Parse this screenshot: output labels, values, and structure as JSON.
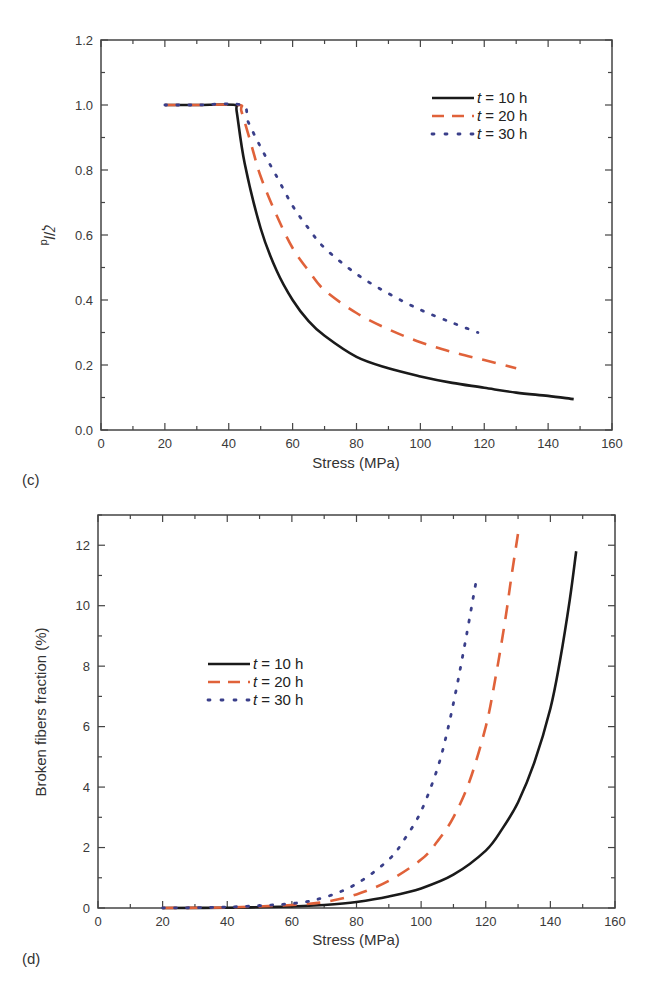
{
  "colors": {
    "t10": "#1a1a1a",
    "t20": "#e0623a",
    "t30": "#3a3f8a",
    "axis": "#444444"
  },
  "chart_data": [
    {
      "panel": "(c)",
      "type": "line",
      "title": "",
      "xlabel": "Stress (MPa)",
      "ylabel": "ζ/ld",
      "xlim": [
        0,
        160
      ],
      "ylim": [
        0.0,
        1.2
      ],
      "xticks": [
        0,
        20,
        40,
        60,
        80,
        100,
        120,
        140,
        160
      ],
      "yticks": [
        "0.0",
        "0.2",
        "0.4",
        "0.6",
        "0.8",
        "1.0",
        "1.2"
      ],
      "grid": false,
      "legend_position": "upper right",
      "series": [
        {
          "name": "t = 10 h",
          "style": "solid",
          "x": [
            20,
            30,
            42,
            42.5,
            45,
            50,
            55,
            60,
            65,
            70,
            80,
            90,
            100,
            110,
            120,
            130,
            140,
            148
          ],
          "y": [
            1.0,
            1.0,
            1.0,
            0.98,
            0.82,
            0.62,
            0.49,
            0.4,
            0.335,
            0.29,
            0.225,
            0.19,
            0.165,
            0.145,
            0.13,
            0.115,
            0.105,
            0.095
          ]
        },
        {
          "name": "t = 20 h",
          "style": "dashed",
          "x": [
            20,
            30,
            43,
            44,
            47,
            50,
            55,
            60,
            65,
            70,
            80,
            90,
            100,
            110,
            120,
            130
          ],
          "y": [
            1.0,
            1.0,
            1.0,
            0.98,
            0.88,
            0.78,
            0.66,
            0.56,
            0.49,
            0.43,
            0.36,
            0.31,
            0.27,
            0.24,
            0.215,
            0.19
          ]
        },
        {
          "name": "t = 30 h",
          "style": "dotted",
          "x": [
            20,
            30,
            44,
            46,
            50,
            55,
            60,
            65,
            70,
            80,
            90,
            100,
            110,
            118
          ],
          "y": [
            1.0,
            1.0,
            1.0,
            0.95,
            0.87,
            0.78,
            0.69,
            0.62,
            0.56,
            0.48,
            0.42,
            0.37,
            0.33,
            0.3
          ]
        }
      ]
    },
    {
      "panel": "(d)",
      "type": "line",
      "title": "",
      "xlabel": "Stress (MPa)",
      "ylabel": "Broken fibers fraction (%)",
      "xlim": [
        0,
        160
      ],
      "ylim": [
        0,
        13
      ],
      "xticks": [
        0,
        20,
        40,
        60,
        80,
        100,
        120,
        140,
        160
      ],
      "yticks": [
        "0",
        "2",
        "4",
        "6",
        "8",
        "10",
        "12"
      ],
      "grid": false,
      "legend_position": "center left",
      "series": [
        {
          "name": "t = 10 h",
          "style": "solid",
          "x": [
            20,
            40,
            60,
            70,
            80,
            90,
            100,
            110,
            120,
            125,
            130,
            135,
            140,
            143,
            146,
            148
          ],
          "y": [
            0,
            0.01,
            0.05,
            0.1,
            0.2,
            0.38,
            0.65,
            1.1,
            1.9,
            2.6,
            3.5,
            4.8,
            6.6,
            8.2,
            10.2,
            11.8
          ]
        },
        {
          "name": "t = 20 h",
          "style": "dashed",
          "x": [
            20,
            40,
            60,
            70,
            80,
            90,
            100,
            105,
            110,
            115,
            120,
            123,
            126,
            128,
            130
          ],
          "y": [
            0,
            0.02,
            0.1,
            0.2,
            0.45,
            0.9,
            1.6,
            2.2,
            3.0,
            4.2,
            6.0,
            7.6,
            9.5,
            11.0,
            12.4
          ]
        },
        {
          "name": "t = 30 h",
          "style": "dotted",
          "x": [
            20,
            40,
            60,
            70,
            80,
            90,
            95,
            100,
            105,
            108,
            111,
            114,
            117
          ],
          "y": [
            0,
            0.03,
            0.15,
            0.35,
            0.8,
            1.6,
            2.3,
            3.2,
            4.6,
            5.8,
            7.3,
            9.0,
            10.8
          ]
        }
      ]
    }
  ]
}
